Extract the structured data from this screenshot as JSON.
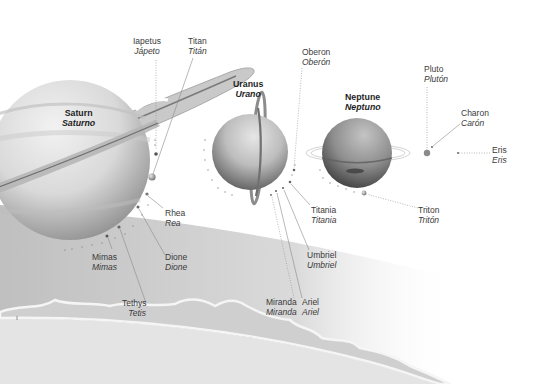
{
  "diagram": {
    "type": "illustration",
    "colors": {
      "background": "#ffffff",
      "label_text": "#3a3a3a",
      "planet_label_text": "#1e1e1e",
      "leader_line": "#8a8a8a"
    },
    "planets": [
      {
        "id": "saturn",
        "name_en": "Saturn",
        "name_es": "Saturno"
      },
      {
        "id": "uranus",
        "name_en": "Uranus",
        "name_es": "Urano"
      },
      {
        "id": "neptune",
        "name_en": "Neptune",
        "name_es": "Neptuno"
      }
    ],
    "dwarf_planets": [
      {
        "id": "pluto",
        "name_en": "Pluto",
        "name_es": "Plutón"
      },
      {
        "id": "eris",
        "name_en": "Eris",
        "name_es": "Eris"
      }
    ],
    "moons": {
      "saturn": [
        {
          "id": "iapetus",
          "name_en": "Iapetus",
          "name_es": "Jápeto"
        },
        {
          "id": "titan",
          "name_en": "Titan",
          "name_es": "Titán"
        },
        {
          "id": "rhea",
          "name_en": "Rhea",
          "name_es": "Rea"
        },
        {
          "id": "dione",
          "name_en": "Dione",
          "name_es": "Dione"
        },
        {
          "id": "mimas",
          "name_en": "Mimas",
          "name_es": "Mimas"
        },
        {
          "id": "tethys",
          "name_en": "Tethys",
          "name_es": "Tetis"
        }
      ],
      "uranus": [
        {
          "id": "oberon",
          "name_en": "Oberon",
          "name_es": "Oberón"
        },
        {
          "id": "titania",
          "name_en": "Titania",
          "name_es": "Titania"
        },
        {
          "id": "umbriel",
          "name_en": "Umbriel",
          "name_es": "Umbriel"
        },
        {
          "id": "miranda",
          "name_en": "Miranda",
          "name_es": "Miranda"
        },
        {
          "id": "ariel",
          "name_en": "Ariel",
          "name_es": "Ariel"
        }
      ],
      "neptune": [
        {
          "id": "triton",
          "name_en": "Triton",
          "name_es": "Tritón"
        }
      ],
      "pluto": [
        {
          "id": "charon",
          "name_en": "Charon",
          "name_es": "Carón"
        }
      ]
    },
    "labels": {
      "saturn": {
        "en": "Saturn",
        "es": "Saturno"
      },
      "uranus": {
        "en": "Uranus",
        "es": "Urano"
      },
      "neptune": {
        "en": "Neptune",
        "es": "Neptuno"
      },
      "pluto": {
        "en": "Pluto",
        "es": "Plutón"
      },
      "eris": {
        "en": "Eris",
        "es": "Eris"
      },
      "iapetus": {
        "en": "Iapetus",
        "es": "Jápeto"
      },
      "titan": {
        "en": "Titan",
        "es": "Titán"
      },
      "rhea": {
        "en": "Rhea",
        "es": "Rea"
      },
      "dione": {
        "en": "Dione",
        "es": "Dione"
      },
      "mimas": {
        "en": "Mimas",
        "es": "Mimas"
      },
      "tethys": {
        "en": "Tethys",
        "es": "Tetis"
      },
      "oberon": {
        "en": "Oberon",
        "es": "Oberón"
      },
      "titania": {
        "en": "Titania",
        "es": "Titania"
      },
      "umbriel": {
        "en": "Umbriel",
        "es": "Umbriel"
      },
      "miranda": {
        "en": "Miranda",
        "es": "Miranda"
      },
      "ariel": {
        "en": "Ariel",
        "es": "Ariel"
      },
      "triton": {
        "en": "Triton",
        "es": "Tritón"
      },
      "charon": {
        "en": "Charon",
        "es": "Carón"
      }
    }
  }
}
